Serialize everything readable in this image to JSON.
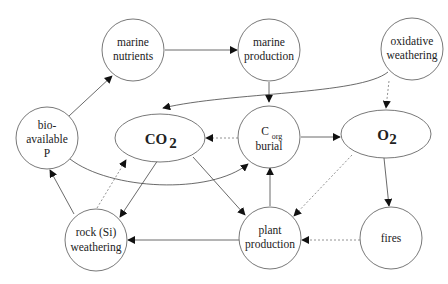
{
  "diagram": {
    "nodes": {
      "marine_nutrients": {
        "line1": "marine",
        "line2": "nutrients"
      },
      "marine_production": {
        "line1": "marine",
        "line2": "production"
      },
      "oxidative_weathering": {
        "line1": "oxidative",
        "line2": "weathering"
      },
      "bioavailable_p": {
        "line1": "bio-",
        "line2": "available",
        "line3": "P"
      },
      "co2": {
        "main": "CO",
        "sub": "2"
      },
      "corg_burial": {
        "main": "C",
        "sub": "org",
        "line2": "burial"
      },
      "o2": {
        "main": "O",
        "sub": "2"
      },
      "rock_weathering": {
        "line1": "rock (Si)",
        "line2": "weathering"
      },
      "plant_production": {
        "line1": "plant",
        "line2": "production"
      },
      "fires": {
        "line1": "fires"
      }
    },
    "edges": [
      {
        "from": "bio-available P",
        "to": "marine nutrients",
        "style": "solid"
      },
      {
        "from": "marine nutrients",
        "to": "marine production",
        "style": "solid"
      },
      {
        "from": "marine production",
        "to": "Corg burial",
        "style": "solid"
      },
      {
        "from": "oxidative weathering",
        "to": "CO2",
        "style": "solid"
      },
      {
        "from": "oxidative weathering",
        "to": "O2",
        "style": "dashed"
      },
      {
        "from": "Corg burial",
        "to": "CO2",
        "style": "dashed"
      },
      {
        "from": "Corg burial",
        "to": "O2",
        "style": "solid"
      },
      {
        "from": "bio-available P",
        "to": "Corg burial",
        "style": "solid"
      },
      {
        "from": "CO2",
        "to": "rock (Si) weathering",
        "style": "solid"
      },
      {
        "from": "CO2",
        "to": "plant production",
        "style": "solid"
      },
      {
        "from": "rock (Si) weathering",
        "to": "CO2",
        "style": "dashed"
      },
      {
        "from": "rock (Si) weathering",
        "to": "bio-available P",
        "style": "solid"
      },
      {
        "from": "plant production",
        "to": "Corg burial",
        "style": "solid"
      },
      {
        "from": "plant production",
        "to": "rock (Si) weathering",
        "style": "solid"
      },
      {
        "from": "O2",
        "to": "plant production",
        "style": "dashed"
      },
      {
        "from": "O2",
        "to": "fires",
        "style": "solid"
      },
      {
        "from": "fires",
        "to": "plant production",
        "style": "dashed"
      }
    ],
    "colors": {
      "stroke": "#555555",
      "text": "#222222",
      "background": "#ffffff"
    }
  }
}
